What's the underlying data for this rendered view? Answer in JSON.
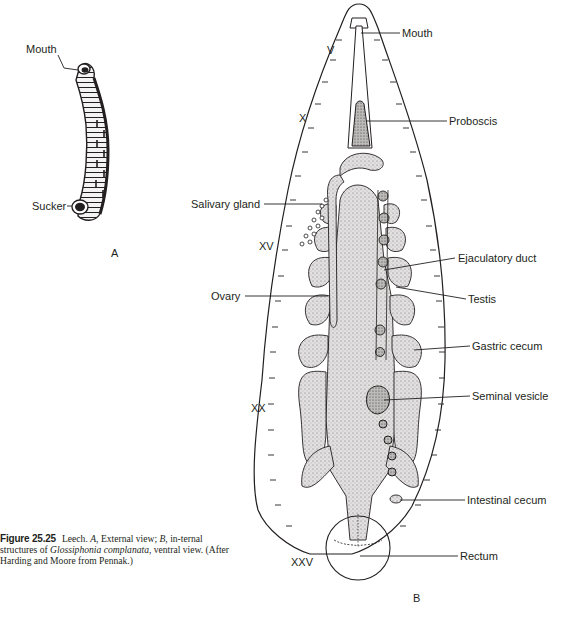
{
  "figure": {
    "panel_a": {
      "panel_letter": "A",
      "labels": {
        "mouth": "Mouth",
        "sucker": "Sucker"
      }
    },
    "panel_b": {
      "panel_letter": "B",
      "segment_markers": {
        "v": "V",
        "x": "X",
        "xv": "XV",
        "xx": "XX",
        "xxv": "XXV"
      },
      "labels": {
        "mouth": "Mouth",
        "proboscis": "Proboscis",
        "salivary_gland": "Salivary gland",
        "ejaculatory_duct": "Ejaculatory duct",
        "testis": "Testis",
        "ovary": "Ovary",
        "gastric_cecum": "Gastric cecum",
        "seminal_vesicle": "Seminal vesicle",
        "intestinal_cecum": "Intestinal cecum",
        "rectum": "Rectum"
      }
    },
    "caption": {
      "figure_number": "Figure 25.25",
      "text_1": "Leech. ",
      "a_ref": "A",
      "text_2": ", External view; ",
      "b_ref": "B",
      "text_3": ", in-ternal structures of ",
      "species": "Glossiphonia complanata",
      "text_4": ", ventral view. (After Harding and Moore from Pennak.)"
    },
    "colors": {
      "ink": "#231f20",
      "stipple": "#d6d4d4",
      "background": "#ffffff"
    }
  }
}
